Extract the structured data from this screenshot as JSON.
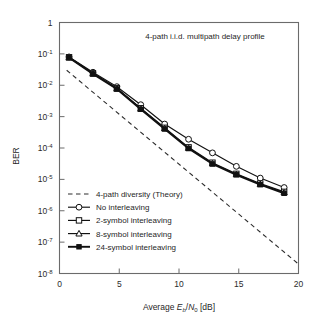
{
  "figure": {
    "annotation": "4-path i.i.d. multipath delay profile",
    "background": "#ffffff",
    "line_color": "#111111"
  },
  "axes": {
    "xlabel_prefix": "Average ",
    "xlabel_e": "E",
    "xlabel_b": "b",
    "xlabel_slash": "/",
    "xlabel_n": "N",
    "xlabel_0": "0",
    "xlabel_unit": " [dB]",
    "ylabel": "BER",
    "x_ticks": [
      "0",
      "5",
      "10",
      "15",
      "20"
    ],
    "y_ticks": [
      "1",
      "10-1",
      "10-2",
      "10-3",
      "10-4",
      "10-5",
      "10-6",
      "10-7",
      "10-8"
    ],
    "y_tick_mantissa": "10",
    "y_tick_exponents": [
      "",
      "-1",
      "-2",
      "-3",
      "-4",
      "-5",
      "-6",
      "-7",
      "-8"
    ]
  },
  "legend": {
    "items": [
      {
        "label": "4-path diversity (Theory)",
        "marker": "dashed-line",
        "style": "dashed"
      },
      {
        "label": "No interleaving",
        "marker": "circle-open",
        "style": "solid"
      },
      {
        "label": "2-symbol interleaving",
        "marker": "square-open",
        "style": "solid"
      },
      {
        "label": "8-symbol interleaving",
        "marker": "triangle-open",
        "style": "solid"
      },
      {
        "label": "24-symbol interleaving",
        "marker": "square-filled",
        "style": "solid-thick"
      }
    ]
  },
  "chart_data": {
    "type": "line",
    "title": "",
    "annotation": "4-path i.i.d. multipath delay profile",
    "xlabel": "Average Eb/N0 [dB]",
    "ylabel": "BER",
    "xlim": [
      0,
      20
    ],
    "ylim": [
      1e-08,
      1
    ],
    "yscale": "log",
    "xticks": [
      0,
      5,
      10,
      15,
      20
    ],
    "yticks": [
      1,
      0.1,
      0.01,
      0.001,
      0.0001,
      1e-05,
      1e-06,
      1e-07,
      1e-08
    ],
    "grid": false,
    "legend_position": "lower-left-inside",
    "series": [
      {
        "name": "4-path diversity (Theory)",
        "marker": "none",
        "style": "dashed",
        "x": [
          0.6,
          20.0
        ],
        "y": [
          0.03,
          2e-08
        ]
      },
      {
        "name": "No interleaving",
        "marker": "circle-open",
        "style": "solid",
        "x": [
          0.8,
          2.8,
          4.8,
          6.8,
          8.8,
          10.8,
          12.8,
          14.8,
          16.8,
          18.8
        ],
        "y": [
          0.08,
          0.026,
          0.009,
          0.0024,
          0.00058,
          0.00019,
          7e-05,
          2.6e-05,
          1.1e-05,
          5.5e-06
        ]
      },
      {
        "name": "2-symbol interleaving",
        "marker": "square-open",
        "style": "solid",
        "x": [
          0.8,
          2.8,
          4.8,
          6.8,
          8.8,
          10.8,
          12.8,
          14.8,
          16.8,
          18.8
        ],
        "y": [
          0.078,
          0.024,
          0.008,
          0.00185,
          0.00044,
          0.000105,
          3.4e-05,
          1.5e-05,
          7.4e-06,
          4e-06
        ]
      },
      {
        "name": "8-symbol interleaving",
        "marker": "triangle-open",
        "style": "solid",
        "x": [
          0.8,
          2.8,
          4.8,
          6.8,
          8.8,
          10.8,
          12.8,
          14.8,
          16.8,
          18.8
        ],
        "y": [
          0.077,
          0.0235,
          0.0078,
          0.00178,
          0.00042,
          0.0001,
          3.2e-05,
          1.45e-05,
          7e-06,
          3.8e-06
        ]
      },
      {
        "name": "24-symbol interleaving",
        "marker": "square-filled",
        "style": "solid-thick",
        "x": [
          0.8,
          2.8,
          4.8,
          6.8,
          8.8,
          10.8,
          12.8,
          14.8,
          16.8,
          18.8
        ],
        "y": [
          0.076,
          0.023,
          0.0076,
          0.00172,
          0.000405,
          9.6e-05,
          3.1e-05,
          1.4e-05,
          6.8e-06,
          3.6e-06
        ]
      }
    ]
  }
}
